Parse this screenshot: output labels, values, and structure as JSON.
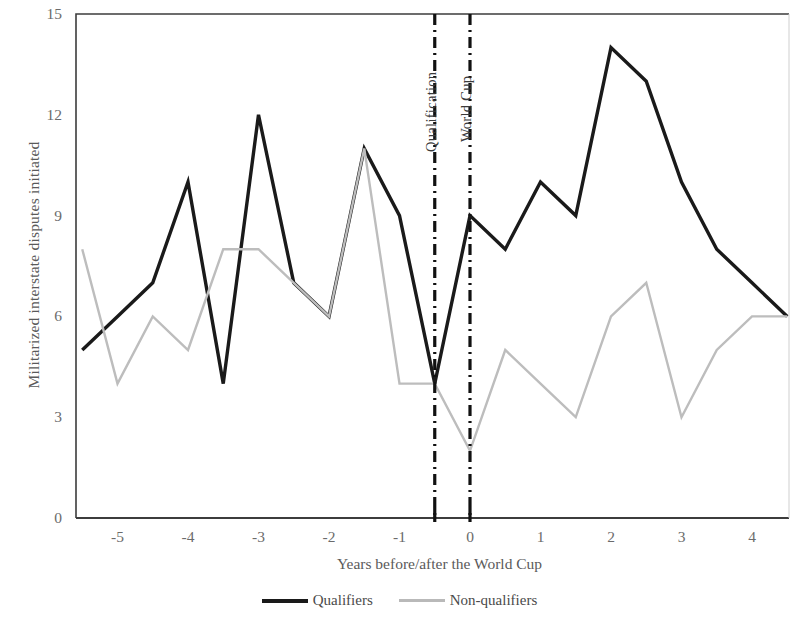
{
  "chart_data": {
    "type": "line",
    "title": "",
    "xlabel": "Years before/after the World Cup",
    "ylabel": "Militarized interstate disputes initiated",
    "xlim": [
      -5.5,
      4.5
    ],
    "ylim": [
      0,
      15
    ],
    "ytick_labels": [
      "0",
      "3",
      "6",
      "9",
      "12",
      "15"
    ],
    "ytick_values": [
      0,
      3,
      6,
      9,
      12,
      15
    ],
    "xtick_labels": [
      "-5",
      "-4",
      "-3",
      "-2",
      "-1",
      "0",
      "1",
      "2",
      "3",
      "4"
    ],
    "xtick_values": [
      -5,
      -4,
      -3,
      -2,
      -1,
      0,
      1,
      2,
      3,
      4
    ],
    "grid": false,
    "legend_position": "bottom",
    "x": [
      -5.5,
      -5,
      -4.5,
      -4,
      -3.5,
      -3,
      -2.5,
      -2,
      -1.5,
      -1,
      -0.5,
      0,
      0.5,
      1,
      1.5,
      2,
      2.5,
      3,
      3.5,
      4,
      4.5
    ],
    "series": [
      {
        "name": "Qualifiers",
        "color": "#1a1a1a",
        "values": [
          5,
          6,
          7,
          10,
          4,
          12,
          7,
          6,
          11,
          9,
          4,
          9,
          8,
          10,
          9,
          14,
          13,
          10,
          8,
          7,
          6
        ]
      },
      {
        "name": "Non-qualifiers",
        "color": "#bdbdbd",
        "values": [
          8,
          4,
          6,
          5,
          8,
          8,
          7,
          6,
          11,
          4,
          4,
          2,
          5,
          4,
          3,
          6,
          7,
          3,
          5,
          6,
          6
        ]
      }
    ],
    "annotations": [
      {
        "label": "Qualification",
        "x": -0.5
      },
      {
        "label": "World Cup",
        "x": 0
      }
    ]
  },
  "legend": {
    "items": [
      {
        "label": "Qualifiers"
      },
      {
        "label": "Non-qualifiers"
      }
    ]
  }
}
